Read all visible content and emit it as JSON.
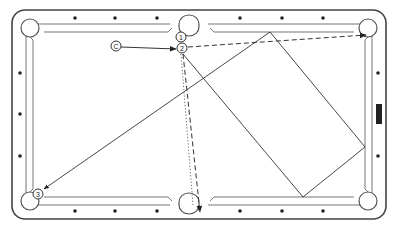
{
  "diagram": {
    "type": "billiards-shot-diagram",
    "colors": {
      "rail": "#444444",
      "line": "#333333",
      "background": "#ffffff",
      "diamond": "#222222"
    },
    "balls": [
      {
        "label": "C",
        "role": "cue-ball",
        "x": 116,
        "y": 46
      },
      {
        "label": "1",
        "role": "object-ball",
        "x": 181,
        "y": 37
      },
      {
        "label": "2",
        "role": "object-ball",
        "x": 182,
        "y": 48
      },
      {
        "label": "3",
        "role": "object-ball",
        "x": 38,
        "y": 194
      }
    ],
    "paths": [
      {
        "name": "cue-to-ball-2",
        "style": "solid-arrow"
      },
      {
        "name": "ball-2-to-top-right-pocket",
        "style": "dashed-arrow"
      },
      {
        "name": "ball-1-to-bottom-side-pocket",
        "style": "dashed-arrow"
      },
      {
        "name": "cue-ball-deflection",
        "style": "dotted"
      },
      {
        "name": "cue-ball-bank-path-to-ball-3",
        "style": "thin-solid-arrow"
      }
    ],
    "pockets": [
      "top-left",
      "top-side",
      "top-right",
      "bottom-left",
      "bottom-side",
      "bottom-right"
    ],
    "marker": {
      "name": "rail-marker",
      "position": "right-rail"
    }
  }
}
